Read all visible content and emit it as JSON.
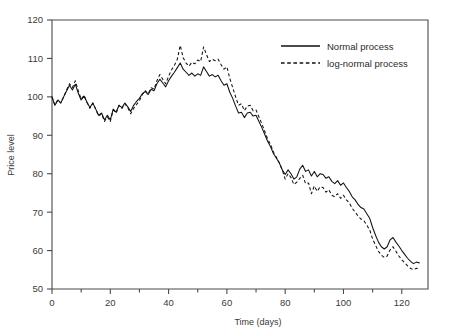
{
  "chart_data": {
    "type": "line",
    "title": "",
    "xlabel": "Time (days)",
    "ylabel": "Price level",
    "xlim": [
      0,
      129
    ],
    "ylim": [
      50,
      120
    ],
    "xticks": [
      0,
      20,
      40,
      60,
      80,
      100,
      120
    ],
    "xticks_minor": [
      10,
      30,
      50,
      70,
      90,
      110
    ],
    "yticks": [
      50,
      60,
      70,
      80,
      90,
      100,
      110,
      120
    ],
    "grid": false,
    "legend_position": "top-right",
    "x": [
      0,
      1,
      2,
      3,
      4,
      5,
      6,
      7,
      8,
      9,
      10,
      11,
      12,
      13,
      14,
      15,
      16,
      17,
      18,
      19,
      20,
      21,
      22,
      23,
      24,
      25,
      26,
      27,
      28,
      29,
      30,
      31,
      32,
      33,
      34,
      35,
      36,
      37,
      38,
      39,
      40,
      41,
      42,
      43,
      44,
      45,
      46,
      47,
      48,
      49,
      50,
      51,
      52,
      53,
      54,
      55,
      56,
      57,
      58,
      59,
      60,
      61,
      62,
      63,
      64,
      65,
      66,
      67,
      68,
      69,
      70,
      71,
      72,
      73,
      74,
      75,
      76,
      77,
      78,
      79,
      80,
      81,
      82,
      83,
      84,
      85,
      86,
      87,
      88,
      89,
      90,
      91,
      92,
      93,
      94,
      95,
      96,
      97,
      98,
      99,
      100,
      101,
      102,
      103,
      104,
      105,
      106,
      107,
      108,
      109,
      110,
      111,
      112,
      113,
      114,
      115,
      116,
      117,
      118,
      119,
      120,
      121,
      122,
      123,
      124,
      125,
      126
    ],
    "series": [
      {
        "name": "Normal process",
        "style": "solid",
        "values": [
          100.0,
          97.8,
          99.2,
          98.4,
          100.0,
          101.5,
          103.0,
          101.8,
          103.3,
          101.0,
          99.2,
          100.2,
          98.6,
          97.2,
          98.4,
          96.8,
          95.2,
          95.8,
          94.0,
          95.2,
          94.0,
          96.8,
          96.0,
          97.8,
          97.2,
          98.4,
          97.4,
          96.2,
          97.8,
          98.8,
          99.6,
          100.8,
          101.4,
          100.6,
          102.0,
          101.6,
          103.4,
          104.6,
          103.6,
          102.6,
          104.2,
          105.4,
          106.4,
          107.6,
          108.8,
          107.2,
          106.4,
          105.6,
          106.2,
          105.4,
          106.0,
          105.6,
          107.8,
          106.6,
          105.4,
          105.8,
          105.2,
          105.6,
          104.2,
          103.0,
          103.4,
          101.2,
          99.6,
          97.6,
          95.8,
          96.0,
          94.6,
          95.8,
          96.0,
          95.0,
          95.2,
          93.6,
          92.0,
          90.2,
          88.4,
          87.0,
          85.2,
          84.0,
          82.8,
          81.0,
          79.8,
          81.0,
          80.0,
          78.6,
          79.2,
          81.2,
          82.2,
          80.6,
          81.0,
          79.4,
          80.6,
          79.2,
          80.0,
          79.8,
          78.8,
          79.2,
          78.0,
          77.4,
          78.2,
          77.0,
          77.6,
          76.4,
          75.4,
          74.0,
          73.2,
          72.0,
          71.2,
          70.8,
          69.6,
          68.4,
          66.0,
          64.0,
          62.2,
          61.0,
          60.4,
          61.0,
          62.8,
          63.4,
          62.2,
          61.2,
          60.0,
          59.0,
          58.0,
          57.2,
          56.6,
          57.0,
          56.8
        ]
      },
      {
        "name": "log-normal process",
        "style": "dashed",
        "values": [
          100.0,
          97.8,
          99.2,
          98.4,
          100.0,
          101.8,
          103.4,
          102.4,
          104.2,
          101.6,
          99.4,
          100.4,
          98.6,
          97.0,
          98.4,
          96.8,
          95.0,
          95.6,
          93.6,
          94.8,
          93.6,
          96.6,
          95.8,
          97.8,
          97.0,
          98.2,
          97.2,
          95.6,
          97.0,
          98.0,
          99.0,
          100.6,
          101.6,
          100.8,
          102.4,
          102.0,
          104.2,
          105.8,
          104.6,
          103.4,
          105.4,
          107.0,
          108.2,
          109.8,
          113.4,
          110.2,
          108.8,
          108.0,
          109.0,
          108.6,
          109.6,
          109.2,
          113.0,
          111.0,
          109.2,
          109.8,
          109.4,
          109.8,
          108.4,
          107.2,
          107.8,
          104.8,
          102.4,
          100.0,
          97.8,
          98.2,
          96.4,
          97.6,
          97.8,
          96.4,
          96.6,
          94.8,
          93.0,
          91.0,
          89.0,
          87.6,
          85.6,
          84.2,
          82.8,
          81.0,
          78.6,
          80.0,
          79.0,
          77.2,
          77.8,
          78.8,
          79.6,
          77.4,
          77.6,
          74.8,
          76.8,
          75.4,
          76.6,
          76.4,
          75.2,
          75.8,
          74.4,
          74.0,
          74.8,
          73.6,
          74.4,
          73.2,
          72.4,
          71.0,
          70.0,
          69.0,
          68.2,
          67.8,
          66.6,
          65.4,
          63.0,
          61.4,
          59.8,
          58.8,
          58.2,
          58.6,
          60.2,
          61.0,
          59.8,
          58.6,
          57.6,
          56.8,
          56.0,
          55.4,
          55.0,
          55.4,
          55.2
        ]
      }
    ]
  }
}
